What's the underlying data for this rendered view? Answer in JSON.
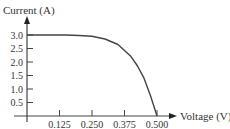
{
  "chart_data": {
    "type": "line",
    "title": "",
    "xlabel": "Voltage (V)",
    "ylabel": "Current (A)",
    "x_ticks": [
      "0.125",
      "0.250",
      "0.375",
      "0.500"
    ],
    "y_ticks": [
      "0.5",
      "1.0",
      "1.5",
      "2.0",
      "2.5",
      "3.0"
    ],
    "xlim": [
      0,
      0.55
    ],
    "ylim": [
      0,
      3.3
    ],
    "grid": false,
    "legend": null,
    "series": [
      {
        "name": "I-V curve",
        "x": [
          0.0,
          0.05,
          0.1,
          0.15,
          0.2,
          0.25,
          0.3,
          0.35,
          0.4,
          0.425,
          0.45,
          0.475,
          0.5
        ],
        "y": [
          3.0,
          3.0,
          3.0,
          3.0,
          2.98,
          2.95,
          2.85,
          2.65,
          2.2,
          1.85,
          1.4,
          0.75,
          0.0
        ]
      }
    ],
    "line_color": "#444444"
  },
  "labels": {
    "y_axis": "Current (A)",
    "x_axis": "Voltage (V)"
  }
}
